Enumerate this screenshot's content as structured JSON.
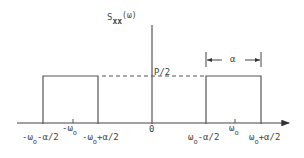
{
  "diagram": {
    "y_label": {
      "main": "S",
      "sub": "xx",
      "arg": "(ω)"
    },
    "level_label": "P/2",
    "width_label": "α",
    "origin_label": "0",
    "ticks": [
      {
        "name": "neg-low-edge",
        "main": "-ω",
        "sub": "o",
        "suffix": "-α/2"
      },
      {
        "name": "neg-center",
        "main": "-ω",
        "sub": "o",
        "suffix": ""
      },
      {
        "name": "neg-high-edge",
        "main": "-ω",
        "sub": "o",
        "suffix": "+α/2"
      },
      {
        "name": "pos-low-edge",
        "main": "ω",
        "sub": "o",
        "suffix": "-α/2"
      },
      {
        "name": "pos-center",
        "main": "ω",
        "sub": "o",
        "suffix": ""
      },
      {
        "name": "pos-high-edge",
        "main": "ω",
        "sub": "o",
        "suffix": "+α/2"
      }
    ],
    "bands": [
      {
        "name": "negative-band",
        "from": "-ω0-α/2",
        "to": "-ω0+α/2",
        "level": "P/2"
      },
      {
        "name": "positive-band",
        "from": "ω0-α/2",
        "to": "ω0+α/2",
        "level": "P/2"
      }
    ]
  }
}
